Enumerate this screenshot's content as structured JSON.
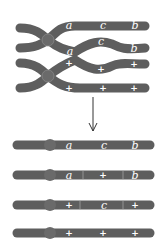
{
  "diagram": {
    "type": "chromosome-crossover",
    "colors": {
      "chromosome": "#5e5e5e",
      "centromere": "#6a6a6a",
      "label": "#ffffff",
      "arrow": "#333333",
      "background": "#ffffff"
    },
    "before": {
      "chromatid_1": {
        "labels": [
          "a",
          "c",
          "b"
        ]
      },
      "chromatid_2": {
        "labels": [
          "a",
          "c",
          "b"
        ]
      },
      "chromatid_3": {
        "labels": [
          "+",
          "+",
          "+"
        ]
      },
      "chromatid_4": {
        "labels": [
          "+",
          "+",
          "+"
        ]
      }
    },
    "arrow": "down-arrow",
    "after": [
      {
        "labels": [
          "a",
          "c",
          "b"
        ]
      },
      {
        "labels": [
          "a",
          "+",
          "b"
        ]
      },
      {
        "labels": [
          "+",
          "c",
          "+"
        ]
      },
      {
        "labels": [
          "+",
          "+",
          "+"
        ]
      }
    ]
  }
}
